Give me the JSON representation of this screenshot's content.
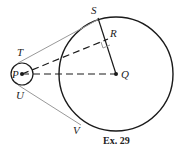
{
  "figure": {
    "caption": "Ex. 29",
    "points": {
      "P": {
        "label": "P",
        "x": 22,
        "y": 74
      },
      "Q": {
        "label": "Q",
        "x": 116,
        "y": 74
      },
      "S": {
        "label": "S",
        "x": 98,
        "y": 18
      },
      "R": {
        "label": "R",
        "x": 108,
        "y": 39
      },
      "T": {
        "label": "T",
        "x": 14,
        "y": 55
      },
      "U": {
        "label": "U",
        "x": 14,
        "y": 93
      },
      "V": {
        "label": "V",
        "x": 80,
        "y": 127
      }
    },
    "circles": {
      "small": {
        "center": "P",
        "r": 11
      },
      "large": {
        "center": "Q",
        "r": 57
      }
    },
    "colors": {
      "stroke": "#1a1a1a",
      "tangent": "#999999"
    }
  }
}
